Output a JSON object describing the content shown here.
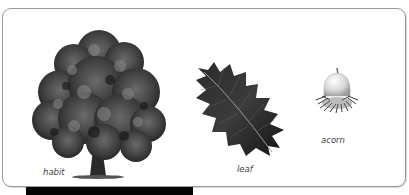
{
  "plate": {
    "items": [
      {
        "id": "habit",
        "label": "habit",
        "icon": "tree-icon"
      },
      {
        "id": "leaf",
        "label": "leaf",
        "icon": "holly-leaf-icon"
      },
      {
        "id": "acorn",
        "label": "acorn",
        "icon": "acorn-icon"
      }
    ]
  },
  "colors": {
    "frame_border": "#9a9a9a",
    "foliage_dark": "#1e1e1e",
    "foliage_mid": "#555555",
    "bar": "#050505"
  }
}
